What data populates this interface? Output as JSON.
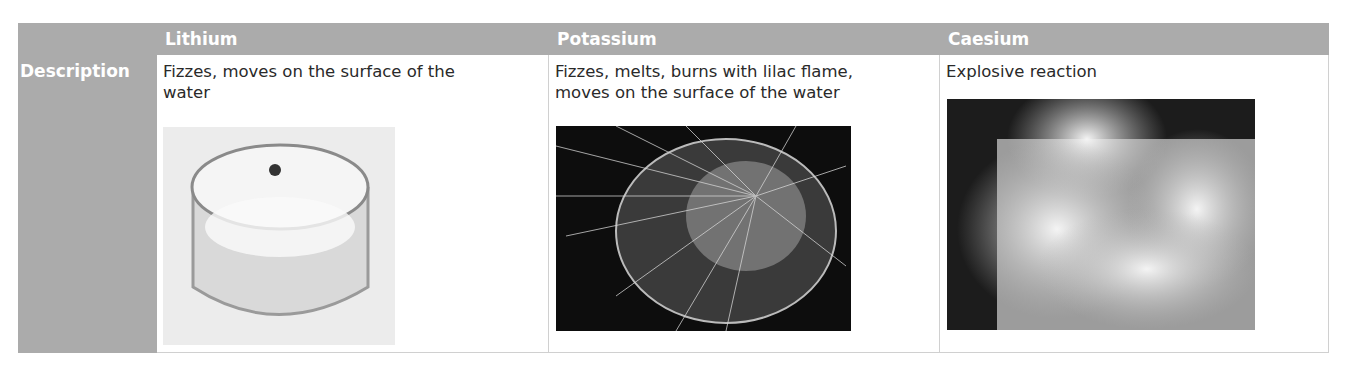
{
  "table": {
    "row_header": "Description",
    "columns": [
      {
        "name": "Lithium",
        "description": "Fizzes, moves on the surface of the water",
        "image": "lithium-in-water-photo"
      },
      {
        "name": "Potassium",
        "description": "Fizzes, melts, burns with lilac flame, moves on the surface of the water",
        "image": "potassium-in-water-photo"
      },
      {
        "name": "Caesium",
        "description": "Explosive reaction",
        "image": "caesium-in-water-photo"
      }
    ]
  },
  "colors": {
    "header_bg": "#ababab",
    "header_text": "#ffffff",
    "body_text": "#2a2a2a"
  }
}
